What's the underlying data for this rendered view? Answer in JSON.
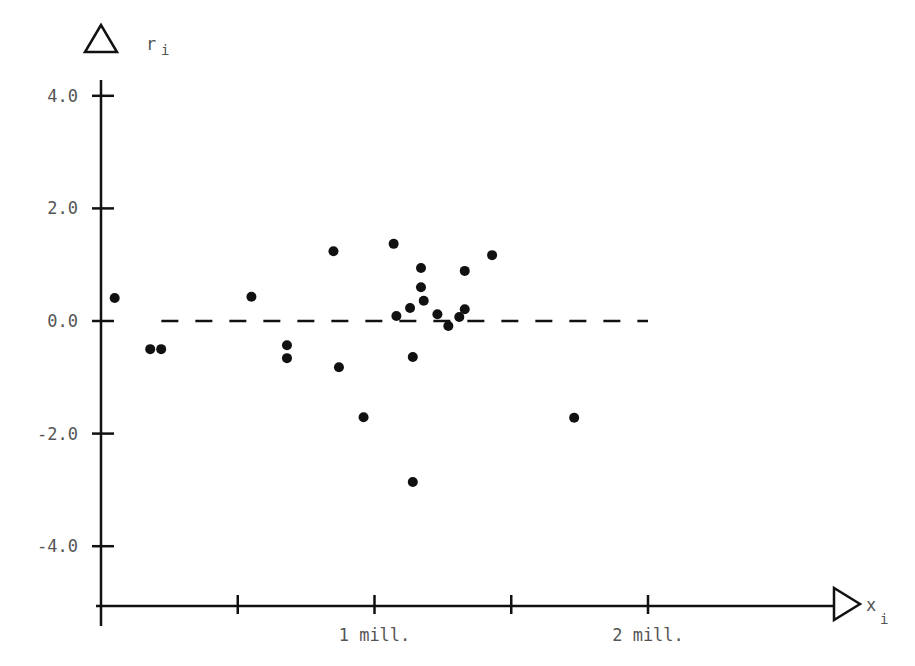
{
  "chart_data": {
    "type": "scatter",
    "title": "",
    "xlabel": "x_i",
    "ylabel": "r_i",
    "x_unit": "millions",
    "xlim": [
      0,
      2.65
    ],
    "ylim": [
      -5.1,
      5.0
    ],
    "grid": false,
    "legend": null,
    "y_ticks": [
      4.0,
      2.0,
      0.0,
      -2.0,
      -4.0
    ],
    "y_tick_labels": [
      "4.0",
      "2.0",
      "0.0",
      "-2.0",
      "-4.0"
    ],
    "x_ticks": [
      0.5,
      1.0,
      1.5,
      2.0
    ],
    "x_tick_labels": [
      "",
      "1 mill.",
      "",
      "2 mill."
    ],
    "reference_line": {
      "y": 0.0,
      "style": "dashed",
      "x_range": [
        0.1,
        2.0
      ]
    },
    "points": [
      {
        "x": 0.05,
        "y": 0.41
      },
      {
        "x": 0.18,
        "y": -0.5
      },
      {
        "x": 0.22,
        "y": -0.5
      },
      {
        "x": 0.55,
        "y": 0.43
      },
      {
        "x": 0.68,
        "y": -0.43
      },
      {
        "x": 0.68,
        "y": -0.66
      },
      {
        "x": 0.85,
        "y": 1.24
      },
      {
        "x": 0.87,
        "y": -0.82
      },
      {
        "x": 0.96,
        "y": -1.71
      },
      {
        "x": 1.07,
        "y": 1.37
      },
      {
        "x": 1.08,
        "y": 0.09
      },
      {
        "x": 1.13,
        "y": 0.23
      },
      {
        "x": 1.14,
        "y": -0.64
      },
      {
        "x": 1.17,
        "y": 0.94
      },
      {
        "x": 1.17,
        "y": 0.6
      },
      {
        "x": 1.18,
        "y": 0.36
      },
      {
        "x": 1.23,
        "y": 0.12
      },
      {
        "x": 1.27,
        "y": -0.09
      },
      {
        "x": 1.31,
        "y": 0.07
      },
      {
        "x": 1.33,
        "y": 0.21
      },
      {
        "x": 1.33,
        "y": 0.89
      },
      {
        "x": 1.43,
        "y": 1.17
      },
      {
        "x": 1.73,
        "y": -1.72
      },
      {
        "x": 1.14,
        "y": -2.86
      }
    ]
  },
  "labels": {
    "y_axis": "r",
    "y_axis_sub": "i",
    "x_axis": "x",
    "x_axis_sub": "i"
  }
}
